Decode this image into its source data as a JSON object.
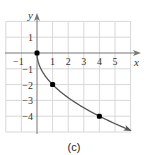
{
  "chart_data": {
    "type": "line",
    "title": "",
    "caption": "(c)",
    "xlabel": "x",
    "ylabel": "y",
    "xlim": [
      -2,
      6
    ],
    "ylim": [
      -5,
      2
    ],
    "grid": true,
    "x_ticks": [
      "-1",
      "1",
      "2",
      "3",
      "4",
      "5"
    ],
    "y_ticks": [
      "1",
      "-1",
      "-2",
      "-3",
      "-4"
    ],
    "series": [
      {
        "name": "y = -2√x",
        "x": [
          0,
          0.25,
          0.5,
          1,
          2,
          3,
          4,
          5,
          5.9
        ],
        "y": [
          0,
          -1,
          -1.41,
          -2,
          -2.83,
          -3.46,
          -4,
          -4.47,
          -4.86
        ],
        "end_arrow": true
      }
    ],
    "points": [
      {
        "x": 0,
        "y": 0
      },
      {
        "x": 1,
        "y": -2
      },
      {
        "x": 4,
        "y": -4
      }
    ],
    "colors": {
      "curve": "#555555",
      "points": "#000000",
      "grid": "#d8d8d8",
      "axes": "#777777"
    }
  }
}
